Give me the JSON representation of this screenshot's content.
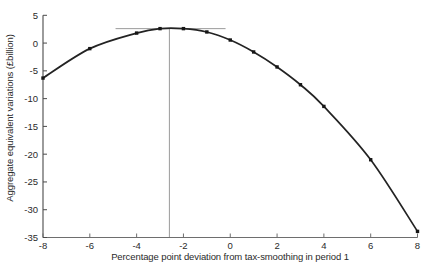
{
  "chart_data": {
    "type": "line",
    "title": "",
    "xlabel": "Percentage point deviation from tax-smoothing in period 1",
    "ylabel": "Aggregate equivalent variations (£billion)",
    "xlim": [
      -8,
      8
    ],
    "ylim": [
      -35,
      5
    ],
    "x_ticks": [
      -8,
      -6,
      -4,
      -2,
      0,
      2,
      4,
      6,
      8
    ],
    "y_ticks": [
      5,
      0,
      -5,
      -10,
      -15,
      -20,
      -25,
      -30,
      -35
    ],
    "grid": false,
    "legend_position": "none",
    "marker_shape": "square",
    "points": [
      [
        -8,
        -6.3
      ],
      [
        -6,
        -1.0
      ],
      [
        -4,
        1.8
      ],
      [
        -3,
        2.6
      ],
      [
        -2,
        2.6
      ],
      [
        -1,
        2.0
      ],
      [
        0,
        0.55
      ],
      [
        1,
        -1.6
      ],
      [
        2,
        -4.3
      ],
      [
        3,
        -7.5
      ],
      [
        4,
        -11.4
      ],
      [
        6,
        -21.0
      ],
      [
        8,
        -33.9
      ]
    ],
    "annotations": {
      "peak_x": -2.6,
      "peak_y": 2.6
    },
    "reference_lines": {
      "vertical": {
        "x": -2.6,
        "y_from": -35,
        "y_to": 2.6
      },
      "horizontal": {
        "y": 2.6,
        "x_from": -4.9,
        "x_to": -0.2
      }
    },
    "colors": {
      "background": "#ffffff",
      "curve": "#232323",
      "marker": "#161616",
      "x_axis": "#6e6e6e",
      "y_axis": "#4a4a4a",
      "reference": "#9b9b9b",
      "text": "#2a2a2a"
    }
  }
}
